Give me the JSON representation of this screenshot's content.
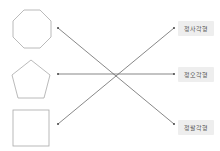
{
  "diagram": {
    "type": "matching",
    "shapes": [
      {
        "name": "octagon",
        "sides": 8
      },
      {
        "name": "pentagon",
        "sides": 5
      },
      {
        "name": "square",
        "sides": 4
      }
    ],
    "labels": [
      {
        "text": "정사각형"
      },
      {
        "text": "정오각형"
      },
      {
        "text": "정팔각형"
      }
    ],
    "connections": [
      {
        "from_shape": 0,
        "to_label": 2
      },
      {
        "from_shape": 1,
        "to_label": 1
      },
      {
        "from_shape": 2,
        "to_label": 0
      }
    ],
    "colors": {
      "shape_stroke": "#a8a8a8",
      "line_stroke": "#555555",
      "label_bg": "#eeeeee",
      "label_text": "#555555"
    }
  }
}
